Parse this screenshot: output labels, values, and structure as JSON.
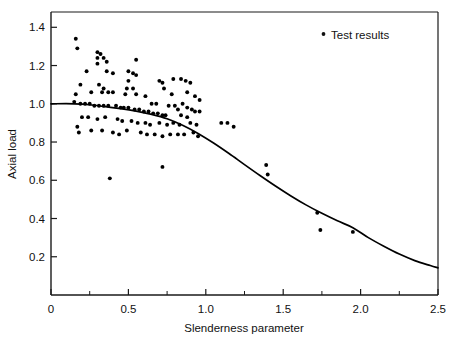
{
  "chart_data": {
    "type": "scatter",
    "title": "",
    "xlabel": "Slenderness parameter",
    "ylabel": "Axial load",
    "xlim": [
      0,
      2.5
    ],
    "ylim": [
      0,
      1.48
    ],
    "grid": false,
    "legend_position": "top-right",
    "legend": [
      {
        "name": "Test results",
        "marker": "dot",
        "color": "#000000"
      }
    ],
    "xticks": [
      0,
      0.5,
      1.0,
      1.5,
      2.0,
      2.5
    ],
    "xtick_labels": [
      "0",
      "0.5",
      "1.0",
      "1.5",
      "2.0",
      "2.5"
    ],
    "xticks_minor": [
      0.25,
      0.75,
      1.25,
      1.75,
      2.25
    ],
    "yticks": [
      0.2,
      0.4,
      0.6,
      0.8,
      1.0,
      1.2,
      1.4
    ],
    "ytick_labels": [
      "0.2",
      "0.4",
      "0.6",
      "0.8",
      "1.0",
      "1.2",
      "1.4"
    ],
    "series": [
      {
        "name": "Test results",
        "type": "scatter",
        "marker": "dot",
        "color": "#000000",
        "points": [
          [
            0.16,
            1.34
          ],
          [
            0.17,
            1.29
          ],
          [
            0.3,
            1.27
          ],
          [
            0.32,
            1.26
          ],
          [
            0.3,
            1.24
          ],
          [
            0.34,
            1.24
          ],
          [
            0.36,
            1.22
          ],
          [
            0.3,
            1.21
          ],
          [
            0.55,
            1.23
          ],
          [
            0.23,
            1.17
          ],
          [
            0.36,
            1.17
          ],
          [
            0.4,
            1.16
          ],
          [
            0.5,
            1.17
          ],
          [
            0.53,
            1.16
          ],
          [
            0.55,
            1.15
          ],
          [
            0.5,
            1.12
          ],
          [
            0.19,
            1.1
          ],
          [
            0.31,
            1.1
          ],
          [
            0.34,
            1.08
          ],
          [
            0.49,
            1.08
          ],
          [
            0.53,
            1.08
          ],
          [
            0.7,
            1.12
          ],
          [
            0.72,
            1.11
          ],
          [
            0.73,
            1.08
          ],
          [
            0.79,
            1.13
          ],
          [
            0.84,
            1.13
          ],
          [
            0.87,
            1.12
          ],
          [
            0.9,
            1.11
          ],
          [
            0.16,
            1.05
          ],
          [
            0.26,
            1.06
          ],
          [
            0.33,
            1.06
          ],
          [
            0.37,
            1.06
          ],
          [
            0.4,
            1.06
          ],
          [
            0.48,
            1.05
          ],
          [
            0.55,
            1.05
          ],
          [
            0.61,
            1.04
          ],
          [
            0.78,
            1.05
          ],
          [
            0.88,
            1.06
          ],
          [
            0.93,
            1.04
          ],
          [
            0.96,
            1.02
          ],
          [
            0.15,
            1.01
          ],
          [
            0.19,
            1.0
          ],
          [
            0.22,
            1.0
          ],
          [
            0.25,
            1.0
          ],
          [
            0.28,
            0.99
          ],
          [
            0.31,
            0.99
          ],
          [
            0.34,
            0.99
          ],
          [
            0.37,
            0.99
          ],
          [
            0.42,
            0.99
          ],
          [
            0.45,
            0.98
          ],
          [
            0.47,
            0.98
          ],
          [
            0.5,
            0.98
          ],
          [
            0.54,
            0.97
          ],
          [
            0.57,
            0.97
          ],
          [
            0.6,
            0.96
          ],
          [
            0.63,
            0.96
          ],
          [
            0.66,
            0.95
          ],
          [
            0.69,
            0.95
          ],
          [
            0.72,
            0.94
          ],
          [
            0.74,
            0.94
          ],
          [
            0.65,
            1.0
          ],
          [
            0.68,
            1.0
          ],
          [
            0.76,
            0.99
          ],
          [
            0.8,
            0.99
          ],
          [
            0.82,
            0.97
          ],
          [
            0.85,
            1.0
          ],
          [
            0.88,
            0.98
          ],
          [
            0.91,
            0.97
          ],
          [
            0.93,
            0.96
          ],
          [
            0.96,
            0.96
          ],
          [
            0.84,
            0.94
          ],
          [
            0.88,
            0.93
          ],
          [
            0.2,
            0.93
          ],
          [
            0.24,
            0.93
          ],
          [
            0.3,
            0.92
          ],
          [
            0.35,
            0.93
          ],
          [
            0.43,
            0.92
          ],
          [
            0.46,
            0.91
          ],
          [
            0.52,
            0.91
          ],
          [
            0.56,
            0.9
          ],
          [
            0.61,
            0.9
          ],
          [
            0.64,
            0.89
          ],
          [
            0.7,
            0.9
          ],
          [
            0.75,
            0.89
          ],
          [
            0.79,
            0.9
          ],
          [
            0.83,
            0.89
          ],
          [
            0.9,
            0.9
          ],
          [
            0.94,
            0.89
          ],
          [
            0.17,
            0.88
          ],
          [
            0.18,
            0.85
          ],
          [
            0.26,
            0.86
          ],
          [
            0.33,
            0.86
          ],
          [
            0.4,
            0.85
          ],
          [
            0.44,
            0.84
          ],
          [
            0.49,
            0.86
          ],
          [
            0.58,
            0.85
          ],
          [
            0.62,
            0.84
          ],
          [
            0.67,
            0.84
          ],
          [
            0.72,
            0.83
          ],
          [
            0.77,
            0.84
          ],
          [
            0.82,
            0.84
          ],
          [
            0.86,
            0.84
          ],
          [
            0.92,
            0.85
          ],
          [
            0.95,
            0.83
          ],
          [
            0.38,
            0.61
          ],
          [
            0.72,
            0.67
          ],
          [
            1.1,
            0.9
          ],
          [
            1.14,
            0.9
          ],
          [
            1.18,
            0.88
          ],
          [
            1.39,
            0.68
          ],
          [
            1.4,
            0.63
          ],
          [
            1.72,
            0.43
          ],
          [
            1.74,
            0.34
          ],
          [
            1.95,
            0.33
          ]
        ]
      },
      {
        "name": "Design curve",
        "type": "line",
        "color": "#000000",
        "points": [
          [
            0.0,
            1.0
          ],
          [
            0.15,
            1.0
          ],
          [
            0.25,
            0.995
          ],
          [
            0.35,
            0.985
          ],
          [
            0.45,
            0.975
          ],
          [
            0.55,
            0.962
          ],
          [
            0.65,
            0.945
          ],
          [
            0.75,
            0.922
          ],
          [
            0.85,
            0.888
          ],
          [
            0.95,
            0.845
          ],
          [
            1.05,
            0.795
          ],
          [
            1.15,
            0.74
          ],
          [
            1.25,
            0.682
          ],
          [
            1.35,
            0.625
          ],
          [
            1.45,
            0.57
          ],
          [
            1.55,
            0.518
          ],
          [
            1.65,
            0.47
          ],
          [
            1.75,
            0.427
          ],
          [
            1.85,
            0.388
          ],
          [
            1.95,
            0.352
          ],
          [
            2.05,
            0.3
          ],
          [
            2.15,
            0.255
          ],
          [
            2.25,
            0.214
          ],
          [
            2.35,
            0.18
          ],
          [
            2.45,
            0.154
          ],
          [
            2.5,
            0.142
          ]
        ]
      }
    ]
  },
  "legend_entry": {
    "label": "Test results"
  },
  "axis": {
    "x_title": "Slenderness parameter",
    "y_title": "Axial load"
  }
}
